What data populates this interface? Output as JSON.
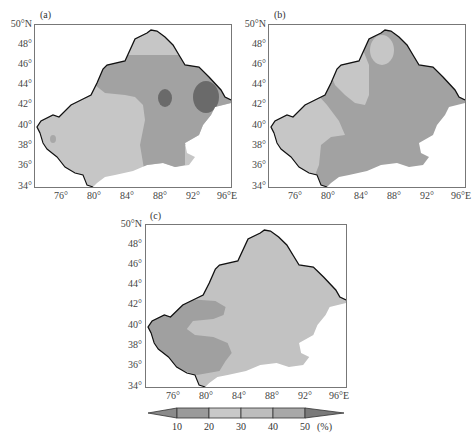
{
  "figure": {
    "panels": [
      {
        "label": "(a)"
      },
      {
        "label": "(b)"
      },
      {
        "label": "(c)"
      }
    ],
    "yticks": [
      "50°N",
      "48°",
      "46°",
      "44°",
      "42°",
      "40°",
      "38°",
      "36°",
      "34°"
    ],
    "xticks": [
      "76°",
      "80°",
      "84°",
      "88°",
      "92°",
      "96°E"
    ],
    "colorbar": {
      "ticks": [
        "10",
        "20",
        "30",
        "40",
        "50"
      ],
      "unit": "(%)",
      "colors": [
        "#8a8a8a",
        "#9a9a9a",
        "#c8c8c8",
        "#bdbdbd",
        "#a8a8a8",
        "#909090",
        "#7a7a7a"
      ]
    },
    "colors": {
      "low": "#c4c4c4",
      "mid": "#a6a6a6",
      "high": "#6e6e6e",
      "border": "#111111"
    }
  }
}
